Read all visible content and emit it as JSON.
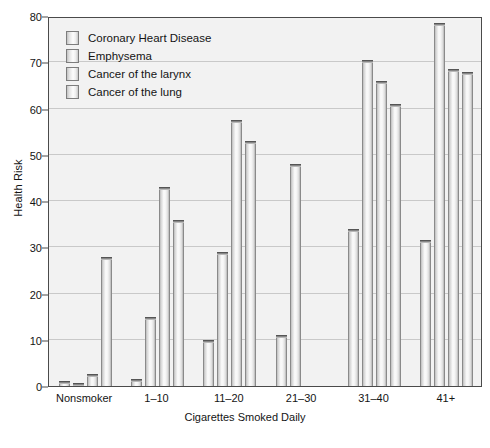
{
  "chart_data": {
    "type": "bar",
    "title": "",
    "xlabel": "Cigarettes Smoked Daily",
    "ylabel": "Health Risk",
    "categories": [
      "Nonsmoker",
      "1–10",
      "11–20",
      "21–30",
      "31–40",
      "41+"
    ],
    "series": [
      {
        "name": "Coronary Heart Disease",
        "values": [
          1,
          1.5,
          10,
          11,
          34,
          31.5
        ]
      },
      {
        "name": "Emphysema",
        "values": [
          0.6,
          15,
          29,
          48,
          70.5,
          78.5
        ]
      },
      {
        "name": "Cancer of the larynx",
        "values": [
          2.5,
          43,
          57.5,
          0,
          66,
          68.5
        ]
      },
      {
        "name": "Cancer of the lung",
        "values": [
          28,
          36,
          53,
          0,
          61,
          68
        ]
      }
    ],
    "ylim": [
      0,
      80
    ],
    "yticks": [
      0,
      10,
      20,
      30,
      40,
      50,
      60,
      70,
      80
    ],
    "ytick_labels": [
      "0",
      "10",
      "20",
      "30",
      "40",
      "50",
      "60",
      "70",
      "80"
    ],
    "grid": true,
    "legend_position": "upper-left",
    "legend_entries": [
      "Coronary Heart Disease",
      "Emphysema",
      "Cancer of the larynx",
      "Cancer of the lung"
    ],
    "colors": {
      "plot_background": "#f2f2f2",
      "frame": "#4a4a4a",
      "gridline": "#c9c9c9",
      "bar_fill": "#f4f4f4",
      "bar_edge": "#8a8a8a",
      "bar_cap": "#6e6e6e",
      "text": "#141414"
    }
  }
}
